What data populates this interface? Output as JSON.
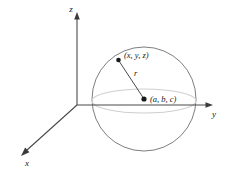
{
  "figure": {
    "background_color": "#ffffff",
    "axis_color": "#4a4a4a",
    "sphere_color": "#6b6b6b",
    "equator_color": "#c8c8c8",
    "radius_line_color": "#4a4a4a",
    "point_color": "#1a1a1a",
    "text_color": "#1a1a1a"
  },
  "axes": {
    "z_label": "z",
    "y_label": "y",
    "x_label": "x",
    "origin": {
      "x": 77,
      "y": 105
    },
    "z_tip": {
      "x": 77,
      "y": 14
    },
    "y_tip": {
      "x": 213,
      "y": 105
    },
    "x_tip": {
      "x": 22,
      "y": 155
    }
  },
  "sphere": {
    "center": {
      "x": 144,
      "y": 99
    },
    "radius_px": 52,
    "equator_rx": 52,
    "equator_ry": 12
  },
  "labels": {
    "surface_point": "(x, y, z)",
    "center_point": "(a, b, c)",
    "radius": "r"
  },
  "points": {
    "surface": {
      "x": 118,
      "y": 60
    },
    "center": {
      "x": 144,
      "y": 99
    }
  }
}
